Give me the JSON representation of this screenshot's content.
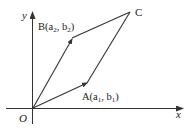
{
  "diagram": {
    "type": "vector-parallelogram",
    "axes": {
      "x_label": "x",
      "y_label": "y",
      "origin_label": "O"
    },
    "points": {
      "A": {
        "name": "A",
        "coord_label": "A(a",
        "sub1": "1",
        "mid": ",  b",
        "sub2": "1",
        "close": ")"
      },
      "B": {
        "name": "B",
        "coord_label": "B(a",
        "sub1": "2",
        "mid": ",  b",
        "sub2": "2",
        "close": ")"
      },
      "C": {
        "name": "C",
        "label": "C"
      }
    },
    "colors": {
      "line": "#333333",
      "text": "#222222",
      "background": "#ffffff"
    }
  }
}
